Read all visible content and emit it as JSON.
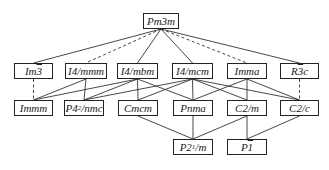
{
  "diagram": {
    "title": "",
    "nodes": [
      {
        "id": "Pm3m",
        "parts": [
          "Pm3m"
        ],
        "x": 143,
        "y": 13,
        "w": 36,
        "row": 1
      },
      {
        "id": "Im-3",
        "parts": [
          "Im",
          "3",
          ""
        ],
        "bar": 1,
        "x": 14,
        "y": 63,
        "w": 39,
        "row": 2
      },
      {
        "id": "I4/mmm",
        "parts": [
          "I4/mmm"
        ],
        "x": 65,
        "y": 63,
        "w": 42,
        "row": 2
      },
      {
        "id": "I4/mbm",
        "parts": [
          "I4/mbm"
        ],
        "x": 117,
        "y": 63,
        "w": 41,
        "row": 2
      },
      {
        "id": "I4/mcm",
        "parts": [
          "I4/mcm"
        ],
        "x": 172,
        "y": 63,
        "w": 41,
        "row": 2
      },
      {
        "id": "Imma",
        "parts": [
          "Imma"
        ],
        "x": 227,
        "y": 63,
        "w": 40,
        "row": 2
      },
      {
        "id": "R-3c",
        "parts": [
          "R",
          "3",
          "c"
        ],
        "bar": 1,
        "x": 280,
        "y": 63,
        "w": 39,
        "row": 2
      },
      {
        "id": "Immm",
        "parts": [
          "Immm"
        ],
        "x": 14,
        "y": 100,
        "w": 39,
        "row": 3
      },
      {
        "id": "P42/nmc",
        "parts": [
          "P4",
          "2",
          "/nmc"
        ],
        "sub": 1,
        "x": 64,
        "y": 100,
        "w": 40,
        "row": 3
      },
      {
        "id": "Cmcm",
        "parts": [
          "Cmcm"
        ],
        "x": 118,
        "y": 100,
        "w": 40,
        "row": 3
      },
      {
        "id": "Pnma",
        "parts": [
          "Pnma"
        ],
        "x": 173,
        "y": 100,
        "w": 40,
        "row": 3
      },
      {
        "id": "C2/m",
        "parts": [
          "C2/m"
        ],
        "x": 227,
        "y": 100,
        "w": 40,
        "row": 3
      },
      {
        "id": "C2/c",
        "parts": [
          "C2/c"
        ],
        "x": 280,
        "y": 100,
        "w": 39,
        "row": 3
      },
      {
        "id": "P21/m",
        "parts": [
          "P2",
          "1",
          "/m"
        ],
        "sub": 1,
        "x": 173,
        "y": 139,
        "w": 40,
        "row": 4
      },
      {
        "id": "P-1",
        "parts": [
          "P",
          "1",
          ""
        ],
        "bar": 1,
        "x": 227,
        "y": 139,
        "w": 40,
        "row": 4
      }
    ],
    "edges": [
      {
        "from": "Pm3m",
        "to": "Im-3",
        "style": "solid"
      },
      {
        "from": "Pm3m",
        "to": "I4/mmm",
        "style": "dashed"
      },
      {
        "from": "Pm3m",
        "to": "I4/mbm",
        "style": "solid"
      },
      {
        "from": "Pm3m",
        "to": "I4/mcm",
        "style": "solid"
      },
      {
        "from": "Pm3m",
        "to": "Imma",
        "style": "dashed"
      },
      {
        "from": "Pm3m",
        "to": "R-3c",
        "style": "solid"
      },
      {
        "from": "Im-3",
        "to": "Immm",
        "style": "dashed"
      },
      {
        "from": "I4/mmm",
        "to": "Immm",
        "style": "solid"
      },
      {
        "from": "I4/mmm",
        "to": "P42/nmc",
        "style": "solid"
      },
      {
        "from": "I4/mbm",
        "to": "Immm",
        "style": "solid"
      },
      {
        "from": "I4/mbm",
        "to": "P42/nmc",
        "style": "solid"
      },
      {
        "from": "I4/mbm",
        "to": "Cmcm",
        "style": "solid"
      },
      {
        "from": "I4/mbm",
        "to": "Pnma",
        "style": "solid"
      },
      {
        "from": "I4/mcm",
        "to": "P42/nmc",
        "style": "solid"
      },
      {
        "from": "I4/mcm",
        "to": "Cmcm",
        "style": "solid"
      },
      {
        "from": "I4/mcm",
        "to": "Pnma",
        "style": "solid"
      },
      {
        "from": "I4/mcm",
        "to": "C2/m",
        "style": "solid"
      },
      {
        "from": "I4/mcm",
        "to": "C2/c",
        "style": "solid"
      },
      {
        "from": "Imma",
        "to": "Pnma",
        "style": "solid"
      },
      {
        "from": "Imma",
        "to": "C2/m",
        "style": "solid"
      },
      {
        "from": "Imma",
        "to": "C2/c",
        "style": "solid"
      },
      {
        "from": "R-3c",
        "to": "C2/c",
        "style": "dashed"
      },
      {
        "from": "Cmcm",
        "to": "P21/m",
        "style": "solid"
      },
      {
        "from": "Pnma",
        "to": "P21/m",
        "style": "solid"
      },
      {
        "from": "C2/m",
        "to": "P21/m",
        "style": "solid"
      },
      {
        "from": "C2/m",
        "to": "P-1",
        "style": "solid"
      },
      {
        "from": "C2/c",
        "to": "P-1",
        "style": "solid"
      }
    ],
    "colors": {
      "line": "#333333",
      "box_border": "#222222",
      "text": "#222222",
      "background": "#ffffff"
    }
  }
}
